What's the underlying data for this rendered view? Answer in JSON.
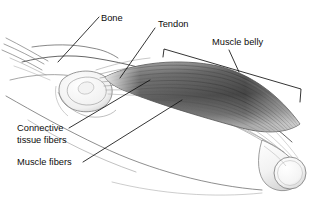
{
  "figure": {
    "name": "skeletal-muscle-structure-diagram",
    "background_color": "#ffffff",
    "label_color": "#0d0d0d",
    "line_color": "#1a1a1a",
    "muscle_dark": "#4a4a4a",
    "muscle_mid": "#767676",
    "muscle_light": "#b8b8b8",
    "bone_fill": "#fafafa",
    "bone_outline": "#8d8d8d"
  },
  "labels": {
    "bone": "Bone",
    "tendon": "Tendon",
    "muscle_belly": "Muscle belly",
    "connective_tissue_line1": "Connective",
    "connective_tissue_line2": "tissue fibers",
    "muscle_fibers": "Muscle fibers"
  },
  "parts": {
    "bone_shaft": "bone-shaft",
    "bone_head_left": "bone-head-left",
    "bone_head_right": "bone-head-right",
    "tendon_fan": "tendon-fan",
    "muscle_belly_body": "muscle-belly-body",
    "limb_outline": "limb-outline",
    "muscle_belly_bracket": "muscle-belly-bracket"
  }
}
